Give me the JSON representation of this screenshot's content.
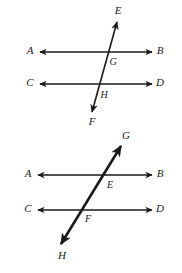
{
  "figure": {
    "background_color": "#ffffff",
    "stroke_color": "#1a1a1a",
    "label_color": "#1a1a1a",
    "diagrams": [
      {
        "name": "top-diagram",
        "description": "Parallel lines AB and CD cut by transversal EF; intersections labeled G and H",
        "transversal": {
          "name": "transversal-ef",
          "from_label": "F",
          "to_label": "E",
          "stroke_width": 1.6,
          "x1": 92,
          "y1": 112,
          "x2": 117,
          "y2": 22
        },
        "lines": [
          {
            "name": "line-ab",
            "left_label": "A",
            "right_label": "B",
            "y": 52,
            "x1": 40,
            "x2": 152,
            "stroke_width": 1.4
          },
          {
            "name": "line-cd",
            "left_label": "C",
            "right_label": "D",
            "y": 84,
            "x1": 40,
            "x2": 152,
            "stroke_width": 1.4
          }
        ],
        "labels": [
          {
            "name": "label-a",
            "text": "A",
            "x": 30,
            "y": 51
          },
          {
            "name": "label-b",
            "text": "B",
            "x": 160,
            "y": 51
          },
          {
            "name": "label-c",
            "text": "C",
            "x": 30,
            "y": 83
          },
          {
            "name": "label-d",
            "text": "D",
            "x": 160,
            "y": 83
          },
          {
            "name": "label-e",
            "text": "E",
            "x": 118,
            "y": 11
          },
          {
            "name": "label-f",
            "text": "F",
            "x": 92,
            "y": 122
          },
          {
            "name": "label-g",
            "text": "G",
            "x": 113,
            "y": 63
          },
          {
            "name": "label-h",
            "text": "H",
            "x": 104,
            "y": 96
          }
        ]
      },
      {
        "name": "bottom-diagram",
        "description": "Parallel lines AB and CD cut by transversal GH; intersections labeled E and F",
        "transversal": {
          "name": "transversal-gh",
          "from_label": "H",
          "to_label": "G",
          "stroke_width": 2.6,
          "x1": 61,
          "y1": 244,
          "x2": 121,
          "y2": 146
        },
        "lines": [
          {
            "name": "line-ab",
            "left_label": "A",
            "right_label": "B",
            "y": 175,
            "x1": 38,
            "x2": 152,
            "stroke_width": 1.4
          },
          {
            "name": "line-cd",
            "left_label": "C",
            "right_label": "D",
            "y": 210,
            "x1": 38,
            "x2": 152,
            "stroke_width": 1.4
          }
        ],
        "labels": [
          {
            "name": "label-a",
            "text": "A",
            "x": 28,
            "y": 174
          },
          {
            "name": "label-b",
            "text": "B",
            "x": 160,
            "y": 174
          },
          {
            "name": "label-c",
            "text": "C",
            "x": 28,
            "y": 209
          },
          {
            "name": "label-d",
            "text": "D",
            "x": 160,
            "y": 209
          },
          {
            "name": "label-e",
            "text": "E",
            "x": 110,
            "y": 186
          },
          {
            "name": "label-f",
            "text": "F",
            "x": 88,
            "y": 220
          },
          {
            "name": "label-g",
            "text": "G",
            "x": 126,
            "y": 136
          },
          {
            "name": "label-h",
            "text": "H",
            "x": 62,
            "y": 256
          }
        ]
      }
    ]
  }
}
